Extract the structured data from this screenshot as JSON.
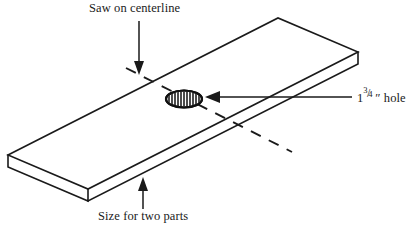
{
  "figure": {
    "type": "isometric-technical-drawing",
    "background_color": "#ffffff",
    "line_color": "#1a1a1a"
  },
  "annotations": {
    "saw": {
      "text": "Saw on centerline",
      "arrow": "down-arrow-icon"
    },
    "size": {
      "text": "Size for two parts",
      "arrow": "up-arrow-icon"
    },
    "hole": {
      "whole": "1",
      "numerator": "3",
      "solidus": "/",
      "denominator": "4",
      "unit": "″",
      "noun": "hole",
      "full_text": "1 3/4″ hole",
      "arrow": "left-arrow-icon"
    }
  },
  "geometry": {
    "board": {
      "top_face": "8,155 278,18 358,52 88,189",
      "front_edge": "8,155 8,167 88,201 88,189",
      "right_edge": "88,189 358,52 358,64 88,201",
      "end_edge": "358,52 358,64"
    },
    "centerline": "126,68 292,152",
    "hole": {
      "cx": 184,
      "cy": 99,
      "rx": 18,
      "ry": 8.5,
      "hatch_count": 13
    }
  }
}
